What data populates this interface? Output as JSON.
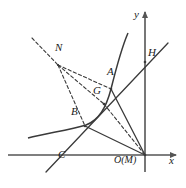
{
  "figure": {
    "kind": "geometry-diagram",
    "width": 186,
    "height": 188,
    "stroke_color": "#3a3a3a",
    "axis_color": "#555555",
    "label_color": "#1a1a1a",
    "background": "#ffffff"
  },
  "axes": {
    "x_label": "x",
    "y_label": "y",
    "origin_label": "O(M)",
    "origin_px": {
      "x": 145,
      "y": 155
    },
    "x_axis": {
      "x1": 8,
      "y1": 155,
      "x2": 176,
      "y2": 155
    },
    "y_axis": {
      "x1": 145,
      "y1": 172,
      "x2": 145,
      "y2": 12
    }
  },
  "points": [
    {
      "name": "N",
      "label": "N",
      "px": {
        "x": 58,
        "y": 65
      },
      "label_px": {
        "x": 55,
        "y": 51
      }
    },
    {
      "name": "A",
      "label": "A",
      "px": {
        "x": 111,
        "y": 89
      },
      "label_px": {
        "x": 107,
        "y": 75
      }
    },
    {
      "name": "H",
      "label": "H",
      "px": {
        "x": 145,
        "y": 62
      },
      "label_px": {
        "x": 148,
        "y": 56
      }
    },
    {
      "name": "G",
      "label": "G",
      "px": {
        "x": 104,
        "y": 104
      },
      "label_px": {
        "x": 93,
        "y": 94
      }
    },
    {
      "name": "B",
      "label": "B",
      "px": {
        "x": 85,
        "y": 126
      },
      "label_px": {
        "x": 71,
        "y": 115
      }
    },
    {
      "name": "C",
      "label": "C",
      "px": {
        "x": 56,
        "y": 155
      },
      "label_px": {
        "x": 58,
        "y": 158
      }
    },
    {
      "name": "O",
      "label": "O(M)",
      "px": {
        "x": 145,
        "y": 155
      },
      "label_px": {
        "x": 114,
        "y": 158
      }
    }
  ],
  "curves": {
    "hyperbola": {
      "name": "hyperbola-branch",
      "path": "M 28 138 C 48 133 70 130 86 125 C 99 120 106 108 111 89 C 116 69 121 49 128 33"
    }
  },
  "solid_segments": [
    {
      "name": "line-C-through-B-to-H",
      "x1": 46,
      "y1": 172,
      "x2": 168,
      "y2": 43
    },
    {
      "name": "segment-A-to-O",
      "x1": 111,
      "y1": 89,
      "x2": 145,
      "y2": 155
    },
    {
      "name": "segment-B-to-O",
      "x1": 85,
      "y1": 126,
      "x2": 145,
      "y2": 155
    }
  ],
  "dashed_segments": [
    {
      "name": "ray-through-N-upper-left",
      "x1": 32,
      "y1": 38,
      "x2": 58,
      "y2": 65
    },
    {
      "name": "segment-N-to-A",
      "x1": 58,
      "y1": 65,
      "x2": 111,
      "y2": 89
    },
    {
      "name": "segment-N-to-G",
      "x1": 58,
      "y1": 65,
      "x2": 104,
      "y2": 104
    },
    {
      "name": "segment-N-to-B",
      "x1": 58,
      "y1": 65,
      "x2": 85,
      "y2": 126
    },
    {
      "name": "segment-G-to-O",
      "x1": 104,
      "y1": 104,
      "x2": 145,
      "y2": 155
    }
  ]
}
